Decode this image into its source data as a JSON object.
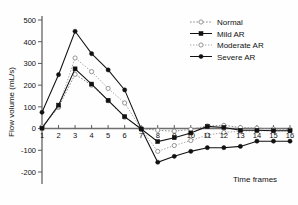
{
  "chart_data": {
    "type": "line",
    "title": "",
    "xlabel": "Time frames",
    "ylabel": "Flow volume (mL/s)",
    "x": [
      1,
      2,
      3,
      4,
      5,
      6,
      7,
      8,
      9,
      10,
      11,
      12,
      13,
      14,
      15,
      16
    ],
    "xticklabels": [
      "1",
      "2",
      "3",
      "4",
      "5",
      "6",
      "7",
      "8",
      "9",
      "10",
      "11",
      "12",
      "13",
      "14",
      "15",
      "16"
    ],
    "yticklabels": [
      "500",
      "400",
      "300",
      "200",
      "100",
      "0",
      "-100",
      "-200"
    ],
    "yticks": [
      500,
      400,
      300,
      200,
      100,
      0,
      -100,
      -200
    ],
    "xlim": [
      1,
      16
    ],
    "ylim": [
      -200,
      500
    ],
    "grid": false,
    "legend_position": "top-right",
    "series": [
      {
        "name": "Normal",
        "marker": "open-circle",
        "linestyle": "dotted",
        "color": "#8d8d8d",
        "values": [
          5,
          98,
          250,
          200,
          128,
          52,
          0,
          -8,
          -12,
          -4,
          12,
          15,
          5,
          2,
          -2,
          -4
        ]
      },
      {
        "name": "Mild AR",
        "marker": "filled-square",
        "linestyle": "solid",
        "color": "#111111",
        "values": [
          2,
          108,
          275,
          205,
          130,
          55,
          -2,
          -60,
          -42,
          -20,
          10,
          5,
          -8,
          -8,
          -10,
          -10
        ]
      },
      {
        "name": "Moderate AR",
        "marker": "open-circle",
        "linestyle": "dotted",
        "color": "#a6a6a6",
        "values": [
          8,
          100,
          325,
          262,
          185,
          118,
          -2,
          -105,
          -78,
          -55,
          -30,
          -18,
          -12,
          -10,
          -10,
          -10
        ]
      },
      {
        "name": "Severe AR",
        "marker": "filled-circle",
        "linestyle": "solid",
        "color": "#111111",
        "values": [
          75,
          248,
          448,
          345,
          270,
          178,
          -2,
          -155,
          -128,
          -105,
          -88,
          -88,
          -82,
          -58,
          -58,
          -58
        ]
      }
    ]
  },
  "legend": {
    "entries": [
      {
        "label": "Normal"
      },
      {
        "label": "Mild AR"
      },
      {
        "label": "Moderate AR"
      },
      {
        "label": "Severe AR"
      }
    ]
  }
}
